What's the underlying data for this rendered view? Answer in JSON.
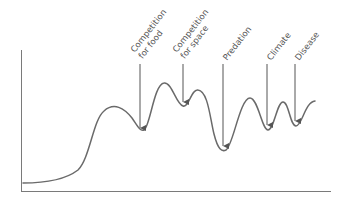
{
  "diagram": {
    "type": "population-growth-curve",
    "x_axis_label": "",
    "y_axis_label": "",
    "colors": {
      "curve": "#6a6a6a",
      "axis": "#7a7a7a",
      "arrow": "#555555",
      "label": "#555555",
      "background": "#ffffff"
    },
    "limiting_factors": [
      {
        "id": "food",
        "line1": "Competition",
        "line2": "for food"
      },
      {
        "id": "space",
        "line1": "Competition",
        "line2": "for space"
      },
      {
        "id": "predation",
        "line1": "Predation",
        "line2": ""
      },
      {
        "id": "climate",
        "line1": "Climate",
        "line2": ""
      },
      {
        "id": "disease",
        "line1": "Disease",
        "line2": ""
      }
    ]
  }
}
